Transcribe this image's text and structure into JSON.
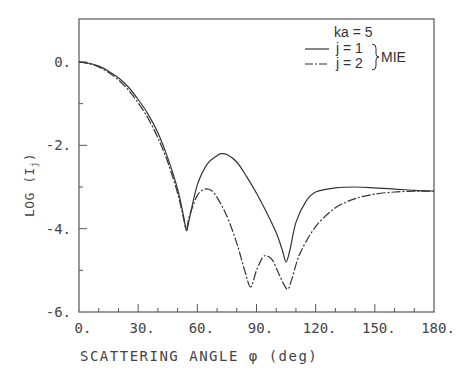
{
  "chart_data": {
    "type": "line",
    "title": "",
    "xlabel": "SCATTERING ANGLE φ (deg)",
    "ylabel": "LOG (Iⱼ)",
    "ylabel_parts": {
      "main": "LOG (I",
      "sub": "j",
      "end": ")"
    },
    "xlim": [
      0,
      180
    ],
    "ylim": [
      -6,
      1
    ],
    "x_ticks": [
      0,
      30,
      60,
      90,
      120,
      150,
      180
    ],
    "x_tick_labels": [
      "0.",
      "30.",
      "60.",
      "90.",
      "120.",
      "150.",
      "180."
    ],
    "x_minor_step": 10,
    "y_ticks": [
      0,
      -2,
      -4,
      -6
    ],
    "y_tick_labels": [
      "0.",
      "-2.",
      "-4.",
      "-6."
    ],
    "y_minor_step": 1,
    "grid": false,
    "legend_position": "upper right",
    "annotation": "ka = 5",
    "legend_group_label": "MIE",
    "series": [
      {
        "name": "j = 1",
        "style": "solid",
        "x": [
          0,
          5,
          10,
          15,
          20,
          25,
          30,
          35,
          40,
          45,
          50,
          53,
          54.5,
          56,
          60,
          65,
          70,
          72,
          75,
          80,
          85,
          90,
          95,
          100,
          103,
          105,
          107,
          110,
          115,
          120,
          130,
          140,
          150,
          160,
          170,
          180
        ],
        "values": [
          0,
          -0.03,
          -0.1,
          -0.22,
          -0.38,
          -0.6,
          -0.9,
          -1.25,
          -1.7,
          -2.3,
          -3.05,
          -3.7,
          -4.05,
          -3.75,
          -2.95,
          -2.45,
          -2.25,
          -2.2,
          -2.22,
          -2.4,
          -2.75,
          -3.15,
          -3.6,
          -4.1,
          -4.5,
          -4.8,
          -4.5,
          -3.85,
          -3.35,
          -3.12,
          -3.02,
          -3.0,
          -3.02,
          -3.05,
          -3.08,
          -3.1
        ]
      },
      {
        "name": "j = 2",
        "style": "dash-dot",
        "x": [
          0,
          5,
          10,
          15,
          20,
          25,
          30,
          35,
          40,
          45,
          50,
          53,
          54.5,
          56,
          60,
          64,
          67,
          70,
          75,
          80,
          84,
          87,
          90,
          93,
          95,
          98,
          101,
          104,
          106,
          108,
          112,
          120,
          130,
          140,
          150,
          160,
          170,
          180
        ],
        "values": [
          0,
          -0.04,
          -0.12,
          -0.25,
          -0.43,
          -0.67,
          -0.98,
          -1.35,
          -1.82,
          -2.4,
          -3.15,
          -3.75,
          -4.0,
          -3.7,
          -3.2,
          -3.05,
          -3.08,
          -3.25,
          -3.7,
          -4.35,
          -5.0,
          -5.4,
          -5.0,
          -4.7,
          -4.65,
          -4.75,
          -5.05,
          -5.35,
          -5.45,
          -5.2,
          -4.6,
          -3.95,
          -3.5,
          -3.28,
          -3.17,
          -3.12,
          -3.1,
          -3.1
        ]
      }
    ]
  }
}
